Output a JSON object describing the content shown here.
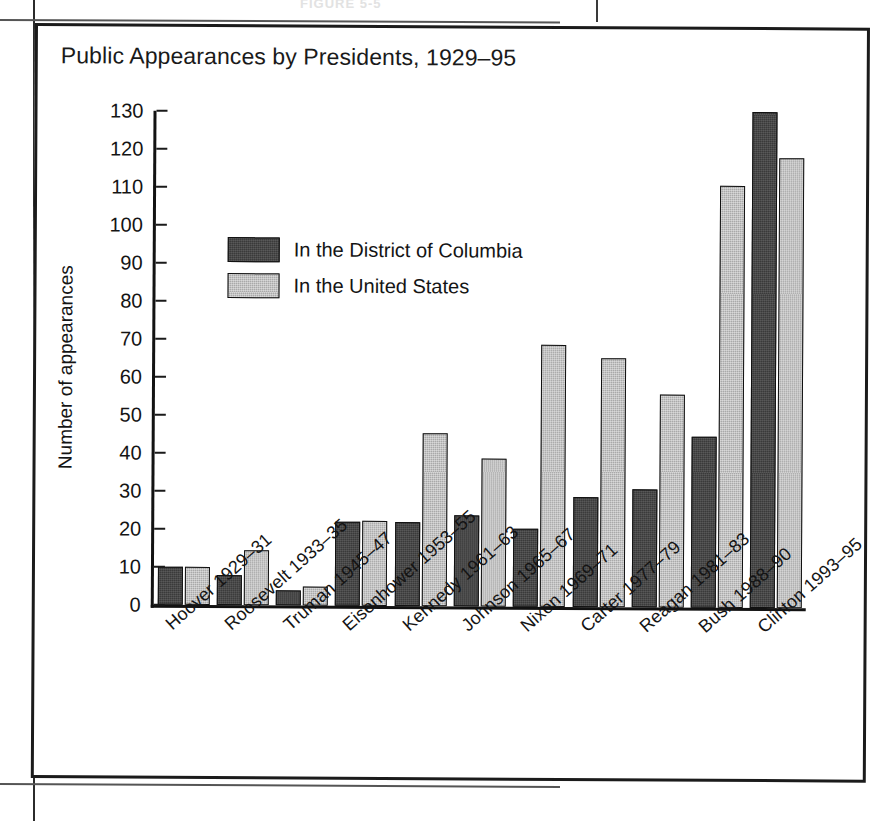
{
  "page": {
    "caption_ghost": "FIGURE 5-5"
  },
  "figure": {
    "title": "Public Appearances by Presidents, 1929–95"
  },
  "legend": {
    "items": [
      {
        "label": "In the District of Columbia",
        "key": "dc",
        "color": "#3a3a3a"
      },
      {
        "label": "In the United States",
        "key": "us",
        "color": "#a9a9a9"
      }
    ]
  },
  "axes": {
    "y_title": "Number of appearances",
    "y_ticks": [
      "0",
      "10",
      "20",
      "30",
      "40",
      "50",
      "60",
      "70",
      "80",
      "90",
      "100",
      "110",
      "120",
      "130"
    ]
  },
  "chart_data": {
    "type": "bar",
    "title": "Public Appearances by Presidents, 1929–95",
    "xlabel": "",
    "ylabel": "Number of appearances",
    "ylim": [
      0,
      130
    ],
    "ytick_step": 10,
    "grid": false,
    "legend_position": "inside-upper-left",
    "categories": [
      "Hoover 1929–31",
      "Roosevelt 1933–35",
      "Truman 1945–47",
      "Eisenhower 1953–55",
      "Kennedy 1961–63",
      "Johnson 1965–67",
      "Nixon 1969–71",
      "Carter 1977–79",
      "Reagan 1981–83",
      "Bush 1988–90",
      "Clinton 1993–95"
    ],
    "series": [
      {
        "name": "In the District of Columbia",
        "color": "#3a3a3a",
        "values": [
          10,
          8,
          4,
          22,
          22,
          24,
          20.5,
          29,
          31,
          45,
          130.5
        ]
      },
      {
        "name": "In the United States",
        "color": "#a9a9a9",
        "values": [
          10,
          14.5,
          5,
          22.5,
          45.5,
          39,
          69,
          65.5,
          56,
          111,
          118.5
        ]
      }
    ]
  }
}
